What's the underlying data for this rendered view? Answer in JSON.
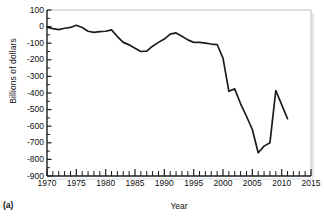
{
  "figure": {
    "panel_label": "(a)",
    "top_remnant_text": "",
    "line_color": "#1c1c1c",
    "frame_color": "#b9bcc2",
    "axis_color": "#1c1c1c",
    "background": "#ffffff"
  },
  "chart_data": {
    "type": "line",
    "title": "",
    "xlabel": "Year",
    "ylabel": "Billions of dollars",
    "xlim": [
      1970,
      2015
    ],
    "ylim": [
      -900,
      100
    ],
    "ytick_step": 100,
    "xtick_label_step": 5,
    "xtick_minor_step": 1,
    "grid": false,
    "legend": null,
    "yticks": [
      100,
      0,
      -100,
      -200,
      -300,
      -400,
      -500,
      -600,
      -700,
      -800,
      -900
    ],
    "ytick_labels": [
      "100",
      "0",
      "-100",
      "-200",
      "-300",
      "-400",
      "-500",
      "-600",
      "-700",
      "-800",
      "-900"
    ],
    "xticks": [
      1970,
      1975,
      1980,
      1985,
      1990,
      1995,
      2000,
      2005,
      2010,
      2015
    ],
    "xtick_labels": [
      "1970",
      "1975",
      "1980",
      "1985",
      "1990",
      "1995",
      "2000",
      "2005",
      "2010",
      "2015"
    ],
    "series": [
      {
        "name": "Federal budget surplus or deficit",
        "color": "#1c1c1c",
        "x": [
          1970,
          1971,
          1972,
          1973,
          1974,
          1975,
          1976,
          1977,
          1978,
          1979,
          1980,
          1981,
          1982,
          1983,
          1984,
          1985,
          1986,
          1987,
          1988,
          1989,
          1990,
          1991,
          1992,
          1993,
          1994,
          1995,
          1996,
          1997,
          1998,
          1999,
          2000,
          2001,
          2002,
          2003,
          2004,
          2005,
          2006,
          2007,
          2008,
          2009,
          2010,
          2011
        ],
        "values": [
          -3,
          -12,
          -18,
          -10,
          -5,
          8,
          -5,
          -28,
          -35,
          -30,
          -28,
          -20,
          -60,
          -95,
          -110,
          -130,
          -150,
          -148,
          -118,
          -95,
          -75,
          -45,
          -38,
          -58,
          -80,
          -95,
          -95,
          -100,
          -105,
          -108,
          -190,
          -390,
          -375,
          -465,
          -540,
          -620,
          -760,
          -720,
          -700,
          -385,
          -470,
          -555
        ]
      }
    ]
  }
}
